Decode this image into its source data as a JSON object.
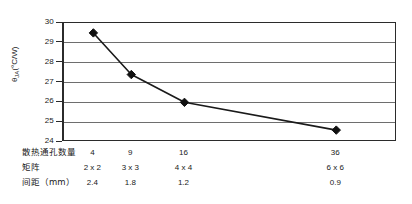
{
  "chart_data": {
    "type": "line",
    "title": "",
    "xlabel": "",
    "ylabel": "θJA(°C/W)",
    "ylabel_symbol": "θ",
    "ylabel_sub": "JA",
    "ylabel_unit": "(°C/W)",
    "categories": [
      "4",
      "9",
      "16",
      "36"
    ],
    "x": [
      4,
      9,
      16,
      36
    ],
    "values": [
      29.5,
      27.4,
      26.0,
      24.6
    ],
    "ylim": [
      24,
      30
    ],
    "yticks": [
      "30",
      "29",
      "28",
      "27",
      "26",
      "25",
      "24"
    ],
    "ytick_values": [
      30,
      29,
      28,
      27,
      26,
      25,
      24
    ],
    "xlim": [
      0,
      44
    ],
    "grid": true,
    "legend": "none",
    "marker": "diamond",
    "series": [
      {
        "name": "θJA",
        "values": [
          29.5,
          27.4,
          26.0,
          24.6
        ]
      }
    ]
  },
  "table": {
    "rows": [
      {
        "label": "散热通孔数量",
        "cells": [
          "4",
          "9",
          "16",
          "36"
        ]
      },
      {
        "label": "矩阵",
        "cells": [
          "2 x 2",
          "3 x 3",
          "4 x 4",
          "6 x 6"
        ]
      },
      {
        "label": "间距（mm）",
        "cells": [
          "2.4",
          "1.8",
          "1.2",
          "0.9"
        ]
      }
    ]
  },
  "colors": {
    "line": "#1a1a1a",
    "marker": "#111111",
    "grid": "#6e6e6e",
    "axis": "#2b2b2b",
    "background": "#ffffff",
    "text": "#1a1a1a"
  }
}
